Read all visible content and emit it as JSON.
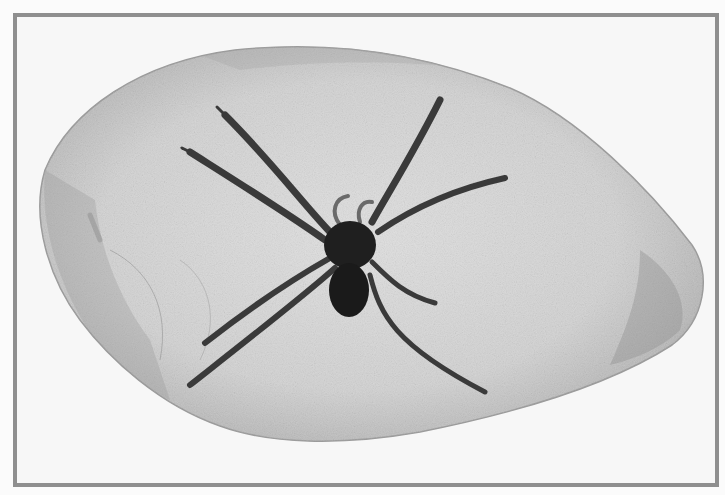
{
  "image": {
    "subject": "spider-in-amber",
    "description": "Grayscale photograph of a spider fossilized inside a polished amber/stone piece, framed by a gray border",
    "colors": {
      "background": "#fbfbfb",
      "frame_border": "#8f8f8f",
      "frame_fill": "#f7f7f7",
      "stone_light": "#d9d9d9",
      "stone_mid": "#bdbdbd",
      "stone_edge": "#8a8a8a",
      "spider_body": "#1c1c1c",
      "spider_legs": "#3a3a3a"
    },
    "frame": {
      "x": 13,
      "y": 13,
      "width": 698,
      "height": 466,
      "border_width": 4
    }
  }
}
